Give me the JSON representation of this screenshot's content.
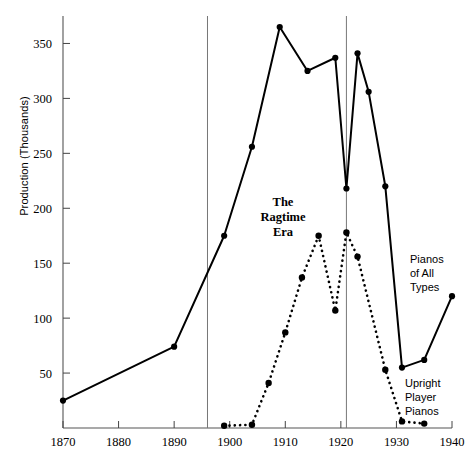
{
  "chart_data": {
    "type": "line",
    "title": "",
    "xlabel": "",
    "ylabel": "Production (Thousands)",
    "xlim": [
      1870,
      1940
    ],
    "ylim": [
      0,
      375
    ],
    "xticks": [
      1870,
      1880,
      1890,
      1900,
      1910,
      1920,
      1930,
      1940
    ],
    "yticks": [
      50,
      100,
      150,
      200,
      250,
      300,
      350
    ],
    "grid": false,
    "legend_position": "inline-annotations",
    "series": [
      {
        "name": "Pianos of All Types",
        "style": "solid",
        "marker": "filled-circle",
        "color": "#000000",
        "points": [
          [
            1870,
            25
          ],
          [
            1890,
            74
          ],
          [
            1899,
            175
          ],
          [
            1904,
            256
          ],
          [
            1909,
            365
          ],
          [
            1914,
            325
          ],
          [
            1919,
            337
          ],
          [
            1921,
            218
          ],
          [
            1923,
            341
          ],
          [
            1925,
            306
          ],
          [
            1928,
            220
          ],
          [
            1931,
            55
          ],
          [
            1935,
            62
          ],
          [
            1940,
            120
          ]
        ]
      },
      {
        "name": "Upright Player Pianos",
        "style": "dotted",
        "marker": "filled-circle",
        "color": "#000000",
        "points": [
          [
            1899,
            2
          ],
          [
            1904,
            3
          ],
          [
            1907,
            41
          ],
          [
            1910,
            87
          ],
          [
            1913,
            137
          ],
          [
            1916,
            175
          ],
          [
            1919,
            107
          ],
          [
            1921,
            178
          ],
          [
            1923,
            156
          ],
          [
            1928,
            53
          ],
          [
            1931,
            6
          ],
          [
            1935,
            4
          ]
        ]
      }
    ],
    "annotations": [
      {
        "name": "ragtime-era",
        "text": "The\nRagtime\nEra",
        "x": 1911,
        "y": 210,
        "bold": true
      },
      {
        "name": "pianos-of-all-types",
        "text": "Pianos\nof All\nTypes",
        "x": 1933.5,
        "y": 150
      },
      {
        "name": "upright-player-pianos",
        "text": "Upright\nPlayer\nPianos",
        "x": 1933.5,
        "y": 42
      }
    ],
    "vertical_reference_lines": [
      {
        "name": "ragtime-era-start",
        "x": 1896
      },
      {
        "name": "ragtime-era-end",
        "x": 1921
      }
    ]
  },
  "axis": {
    "y_label": "Production (Thousands)",
    "y_ticks": [
      "50",
      "100",
      "150",
      "200",
      "250",
      "300",
      "350"
    ],
    "x_ticks": [
      "1870",
      "1880",
      "1890",
      "1900",
      "1910",
      "1920",
      "1930",
      "1940"
    ]
  },
  "annotations": {
    "ragtime": {
      "line1": "The",
      "line2": "Ragtime",
      "line3": "Era"
    },
    "all_types": {
      "line1": "Pianos",
      "line2": "of All",
      "line3": "Types"
    },
    "player": {
      "line1": "Upright",
      "line2": "Player",
      "line3": "Pianos"
    }
  }
}
